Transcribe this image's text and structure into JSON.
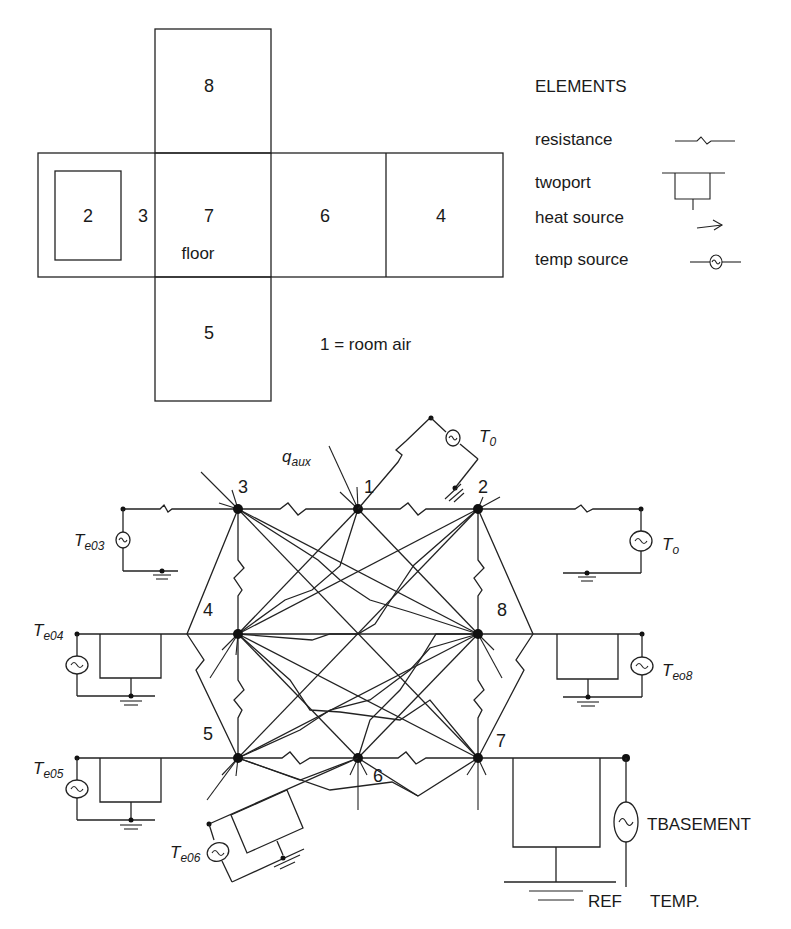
{
  "floor_plan": {
    "rooms": [
      {
        "id": "8",
        "label": "8"
      },
      {
        "id": "2",
        "label": "2"
      },
      {
        "id": "3",
        "label": "3"
      },
      {
        "id": "7",
        "label": "7",
        "sublabel": "floor"
      },
      {
        "id": "6",
        "label": "6"
      },
      {
        "id": "4",
        "label": "4"
      },
      {
        "id": "5",
        "label": "5"
      }
    ],
    "note": "1 = room air"
  },
  "legend": {
    "title": "ELEMENTS",
    "items": [
      {
        "label": "resistance",
        "icon": "resistance-icon"
      },
      {
        "label": "twoport",
        "icon": "twoport-icon"
      },
      {
        "label": "heat source",
        "icon": "heat-source-arrow-icon"
      },
      {
        "label": "temp source",
        "icon": "temp-source-icon"
      }
    ]
  },
  "network": {
    "nodes": [
      {
        "id": "1",
        "label": "1"
      },
      {
        "id": "2",
        "label": "2"
      },
      {
        "id": "3",
        "label": "3"
      },
      {
        "id": "4",
        "label": "4"
      },
      {
        "id": "5",
        "label": "5"
      },
      {
        "id": "6",
        "label": "6"
      },
      {
        "id": "7",
        "label": "7"
      },
      {
        "id": "8",
        "label": "8"
      }
    ],
    "heat_input": {
      "symbol": "q",
      "subscript": "aux"
    },
    "sources": {
      "t0_top": {
        "symbol": "T",
        "subscript": "0"
      },
      "t0_right": {
        "symbol": "T",
        "subscript": "o"
      },
      "te03": {
        "symbol": "T",
        "subscript": "e03"
      },
      "te04": {
        "symbol": "T",
        "subscript": "e04"
      },
      "te05": {
        "symbol": "T",
        "subscript": "e05"
      },
      "te06": {
        "symbol": "T",
        "subscript": "e06"
      },
      "te08": {
        "symbol": "T",
        "subscript": "eo8"
      },
      "tbasement": {
        "label": "TBASEMENT"
      }
    },
    "reference": {
      "label_1": "REF",
      "label_2": "TEMP."
    }
  }
}
